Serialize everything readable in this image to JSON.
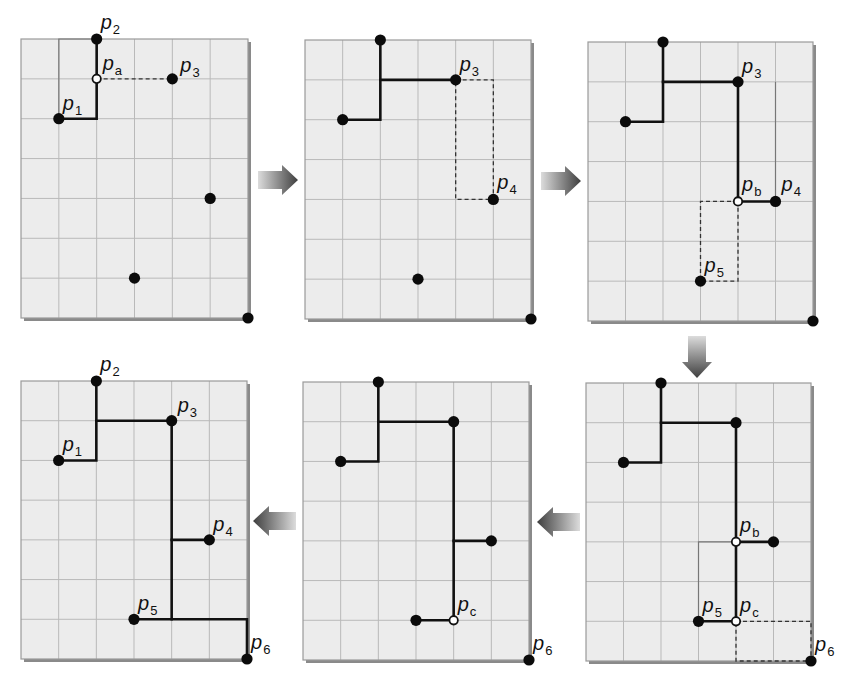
{
  "figure": {
    "title": "",
    "grid": {
      "cols": 6,
      "rows": 7
    },
    "colors": {
      "panel_fill": "#ececec",
      "grid_line": "#b9b9b9",
      "edge": "#111111",
      "arrow_dark": "#4a4a4a",
      "arrow_light": "#d8d8d8"
    }
  },
  "points": {
    "p1": {
      "label": "p",
      "sub": "1",
      "col": 1,
      "row": 2
    },
    "p2": {
      "label": "p",
      "sub": "2",
      "col": 2,
      "row": 0
    },
    "p3": {
      "label": "p",
      "sub": "3",
      "col": 4,
      "row": 1
    },
    "p4": {
      "label": "p",
      "sub": "4",
      "col": 5,
      "row": 4
    },
    "p5": {
      "label": "p",
      "sub": "5",
      "col": 3,
      "row": 6
    },
    "p6": {
      "label": "p",
      "sub": "6",
      "col": 6,
      "row": 7
    },
    "pa": {
      "label": "p",
      "sub": "a",
      "col": 2,
      "row": 1
    },
    "pb": {
      "label": "p",
      "sub": "b",
      "col": 4,
      "row": 4
    },
    "pc": {
      "label": "p",
      "sub": "c",
      "col": 4,
      "row": 6
    }
  },
  "panels": [
    {
      "id": "step-1",
      "box": [
        21,
        39,
        227,
        279
      ],
      "thin_paths": [
        [
          [
            1,
            2
          ],
          [
            1,
            0
          ],
          [
            2,
            0
          ]
        ]
      ],
      "edges": [
        [
          [
            1,
            2
          ],
          [
            2,
            2
          ],
          [
            2,
            0
          ]
        ]
      ],
      "dashed": [
        [
          [
            2,
            1
          ],
          [
            4,
            1
          ]
        ]
      ],
      "solid_points": [
        [
          1,
          2
        ],
        [
          2,
          0
        ],
        [
          4,
          1
        ],
        [
          5,
          4
        ],
        [
          3,
          6
        ],
        [
          6,
          7
        ]
      ],
      "steiner_points": [
        [
          2,
          1
        ]
      ],
      "labels": [
        {
          "key": "p2",
          "dx": 4,
          "dy": -10
        },
        {
          "key": "pa",
          "dx": 6,
          "dy": -9
        },
        {
          "key": "p3",
          "dx": 8,
          "dy": -7
        },
        {
          "key": "p1",
          "dx": 4,
          "dy": -9
        }
      ]
    },
    {
      "id": "step-2",
      "box": [
        305,
        40,
        226,
        279
      ],
      "thin_paths": [],
      "edges": [
        [
          [
            1,
            2
          ],
          [
            2,
            2
          ],
          [
            2,
            0
          ]
        ],
        [
          [
            2,
            1
          ],
          [
            4,
            1
          ]
        ]
      ],
      "dashed": [
        [
          [
            4,
            1
          ],
          [
            5,
            1
          ],
          [
            5,
            4
          ],
          [
            4,
            4
          ],
          [
            4,
            1
          ]
        ]
      ],
      "solid_points": [
        [
          1,
          2
        ],
        [
          2,
          0
        ],
        [
          4,
          1
        ],
        [
          5,
          4
        ],
        [
          3,
          6
        ],
        [
          6,
          7
        ]
      ],
      "steiner_points": [],
      "labels": [
        {
          "key": "p3",
          "dx": 4,
          "dy": -9
        },
        {
          "key": "p4",
          "dx": 4,
          "dy": -10
        }
      ]
    },
    {
      "id": "step-3",
      "box": [
        588,
        42,
        225,
        279
      ],
      "thin_paths": [
        [
          [
            5,
            1
          ],
          [
            5,
            4
          ]
        ]
      ],
      "edges": [
        [
          [
            1,
            2
          ],
          [
            2,
            2
          ],
          [
            2,
            0
          ]
        ],
        [
          [
            2,
            1
          ],
          [
            4,
            1
          ],
          [
            4,
            4
          ],
          [
            5,
            4
          ]
        ]
      ],
      "dashed": [
        [
          [
            4,
            4
          ],
          [
            3,
            4
          ],
          [
            3,
            6
          ],
          [
            4,
            6
          ],
          [
            4,
            4
          ]
        ]
      ],
      "solid_points": [
        [
          1,
          2
        ],
        [
          2,
          0
        ],
        [
          4,
          1
        ],
        [
          5,
          4
        ],
        [
          3,
          6
        ],
        [
          6,
          7
        ]
      ],
      "steiner_points": [
        [
          4,
          4
        ]
      ],
      "labels": [
        {
          "key": "p3",
          "dx": 4,
          "dy": -9
        },
        {
          "key": "pb",
          "dx": 4,
          "dy": -10
        },
        {
          "key": "p4",
          "dx": 6,
          "dy": -10
        },
        {
          "key": "p5",
          "dx": 4,
          "dy": -9
        }
      ]
    },
    {
      "id": "step-4",
      "box": [
        586,
        383,
        225,
        278
      ],
      "thin_paths": [
        [
          [
            3,
            6
          ],
          [
            3,
            4
          ],
          [
            4,
            4
          ]
        ]
      ],
      "edges": [
        [
          [
            1,
            2
          ],
          [
            2,
            2
          ],
          [
            2,
            0
          ]
        ],
        [
          [
            2,
            1
          ],
          [
            4,
            1
          ],
          [
            4,
            6
          ],
          [
            3,
            6
          ]
        ],
        [
          [
            4,
            4
          ],
          [
            5,
            4
          ]
        ]
      ],
      "dashed": [
        [
          [
            4,
            6
          ],
          [
            6,
            6
          ],
          [
            6,
            7
          ],
          [
            4,
            7
          ],
          [
            4,
            6
          ]
        ]
      ],
      "solid_points": [
        [
          1,
          2
        ],
        [
          2,
          0
        ],
        [
          4,
          1
        ],
        [
          5,
          4
        ],
        [
          3,
          6
        ],
        [
          6,
          7
        ]
      ],
      "steiner_points": [
        [
          4,
          4
        ],
        [
          4,
          6
        ]
      ],
      "labels": [
        {
          "key": "pb",
          "dx": 4,
          "dy": -10
        },
        {
          "key": "p5",
          "dx": 4,
          "dy": -9
        },
        {
          "key": "pc",
          "dx": 4,
          "dy": -9
        },
        {
          "key": "p6",
          "dx": 4,
          "dy": -10
        }
      ]
    },
    {
      "id": "step-5",
      "box": [
        303,
        382,
        226,
        278
      ],
      "thin_paths": [],
      "edges": [
        [
          [
            1,
            2
          ],
          [
            2,
            2
          ],
          [
            2,
            0
          ]
        ],
        [
          [
            2,
            1
          ],
          [
            4,
            1
          ],
          [
            4,
            6
          ],
          [
            3,
            6
          ]
        ],
        [
          [
            4,
            4
          ],
          [
            5,
            4
          ]
        ]
      ],
      "dashed": [],
      "solid_points": [
        [
          1,
          2
        ],
        [
          2,
          0
        ],
        [
          4,
          1
        ],
        [
          5,
          4
        ],
        [
          3,
          6
        ],
        [
          6,
          7
        ]
      ],
      "steiner_points": [
        [
          4,
          6
        ]
      ],
      "labels": [
        {
          "key": "pc",
          "dx": 4,
          "dy": -9
        },
        {
          "key": "p6",
          "dx": 4,
          "dy": -10
        }
      ]
    },
    {
      "id": "step-6",
      "box": [
        21,
        381,
        226,
        278
      ],
      "thin_paths": [],
      "edges": [
        [
          [
            1,
            2
          ],
          [
            2,
            2
          ],
          [
            2,
            0
          ]
        ],
        [
          [
            2,
            1
          ],
          [
            4,
            1
          ],
          [
            4,
            6
          ]
        ],
        [
          [
            4,
            4
          ],
          [
            5,
            4
          ]
        ],
        [
          [
            3,
            6
          ],
          [
            6,
            6
          ],
          [
            6,
            7
          ]
        ]
      ],
      "dashed": [],
      "solid_points": [
        [
          1,
          2
        ],
        [
          2,
          0
        ],
        [
          4,
          1
        ],
        [
          5,
          4
        ],
        [
          3,
          6
        ],
        [
          6,
          7
        ]
      ],
      "steiner_points": [],
      "labels": [
        {
          "key": "p2",
          "dx": 4,
          "dy": -10
        },
        {
          "key": "p3",
          "dx": 6,
          "dy": -9
        },
        {
          "key": "p1",
          "dx": 4,
          "dy": -9
        },
        {
          "key": "p4",
          "dx": 4,
          "dy": -9
        },
        {
          "key": "p5",
          "dx": 4,
          "dy": -9
        },
        {
          "key": "p6",
          "dx": 4,
          "dy": -10
        }
      ]
    }
  ],
  "arrows": [
    {
      "id": "arrow-step1-to-step2",
      "direction": "right",
      "x": 258,
      "y": 180,
      "len": 40
    },
    {
      "id": "arrow-step2-to-step3",
      "direction": "right",
      "x": 541,
      "y": 181,
      "len": 40
    },
    {
      "id": "arrow-step3-to-step4",
      "direction": "down",
      "x": 697,
      "y": 336,
      "len": 42
    },
    {
      "id": "arrow-step4-to-step5",
      "direction": "left",
      "x": 580,
      "y": 522,
      "len": 43
    },
    {
      "id": "arrow-step5-to-step6",
      "direction": "left",
      "x": 296,
      "y": 521,
      "len": 43
    }
  ]
}
